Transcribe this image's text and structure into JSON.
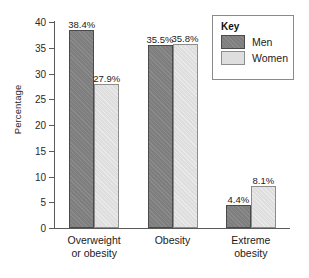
{
  "chart_data": {
    "type": "bar",
    "title": "",
    "xlabel": "",
    "ylabel": "Percentage",
    "ylim": [
      0,
      40
    ],
    "yticks": [
      0,
      5,
      10,
      15,
      20,
      25,
      30,
      35,
      40
    ],
    "ytick_labels": [
      "0",
      "5",
      "10",
      "15",
      "20",
      "25",
      "30",
      "35",
      "40"
    ],
    "grid": false,
    "legend_position": "top-right",
    "legend_title": "Key",
    "categories": [
      "Overweight or obesity",
      "Obesity",
      "Extreme obesity"
    ],
    "category_lines": [
      [
        "Overweight",
        "or obesity"
      ],
      [
        "Obesity",
        ""
      ],
      [
        "Extreme",
        "obesity"
      ]
    ],
    "series": [
      {
        "name": "Men",
        "color": "#7e7e7e",
        "values": [
          38.4,
          35.5,
          4.4
        ],
        "labels": [
          "38.4%",
          "35.5%",
          "4.4%"
        ]
      },
      {
        "name": "Women",
        "color": "#dedede",
        "values": [
          27.9,
          35.8,
          8.1
        ],
        "labels": [
          "27.9%",
          "35.8%",
          "8.1%"
        ]
      }
    ]
  },
  "legend": {
    "title": "Key",
    "entries": [
      {
        "label": "Men",
        "swatch": "men"
      },
      {
        "label": "Women",
        "swatch": "women"
      }
    ]
  },
  "axis": {
    "y_title": "Percentage"
  }
}
